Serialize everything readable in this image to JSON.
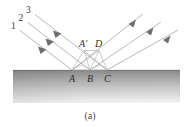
{
  "figure": {
    "caption": "(a)",
    "background_color": "#ffffff"
  },
  "incident_rays": {
    "labels": [
      "1",
      "2",
      "3"
    ],
    "color": "#a8a8a8",
    "arrow_color": "#6b6b6b",
    "direction": "down-right"
  },
  "reflected_rays": {
    "color": "#a8a8a8",
    "arrow_color": "#6b6b6b",
    "direction": "up-right",
    "count": 3
  },
  "wavefront_points": {
    "upper": [
      {
        "label": "A′",
        "x": 83,
        "y": 47
      },
      {
        "label": "D",
        "x": 98,
        "y": 47
      }
    ],
    "surface": [
      {
        "label": "A",
        "x": 72,
        "y": 81
      },
      {
        "label": "B",
        "x": 90,
        "y": 81
      },
      {
        "label": "C",
        "x": 107,
        "y": 81
      }
    ]
  },
  "surface_block": {
    "name": "reflecting-medium",
    "top_color": "#8e8e8e",
    "bottom_color": "#f2f2f2",
    "x": 13,
    "y": 70,
    "width": 167,
    "height": 33
  }
}
